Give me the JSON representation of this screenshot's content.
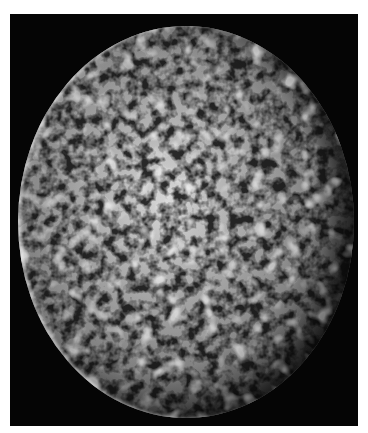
{
  "image": {
    "subject": "cratered moon surface photograph",
    "style": "grayscale",
    "colors": {
      "background": "#ffffff",
      "frame": "#050505",
      "surface_light": "#e0e0e0",
      "surface_mid": "#9a9a9a",
      "surface_dark": "#2a2a2a"
    }
  }
}
